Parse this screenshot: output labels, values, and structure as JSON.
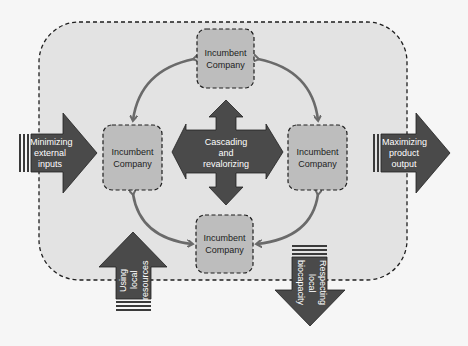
{
  "colors": {
    "background": "#f6f6f6",
    "frame_fill": "#e3e3e3",
    "company_fill": "#bdbdbd",
    "arrow_dark": "#4a4a4a",
    "connector": "#6a6a6a",
    "dash": "#1e1e1e"
  },
  "companies": [
    {
      "id": "top",
      "label": "Incumbent Company"
    },
    {
      "id": "left",
      "label": "Incumbent Company"
    },
    {
      "id": "right",
      "label": "Incumbent Company"
    },
    {
      "id": "bottom",
      "label": "Incumbent Company"
    }
  ],
  "center": {
    "label": "Cascading and revalorizing"
  },
  "flows": {
    "input": {
      "label": "Minimizing external inputs"
    },
    "output": {
      "label": "Maximizing product output"
    },
    "local_resources": {
      "label": "Using local resources"
    },
    "biocapacity": {
      "label": "Respecting local biocapacity"
    }
  }
}
